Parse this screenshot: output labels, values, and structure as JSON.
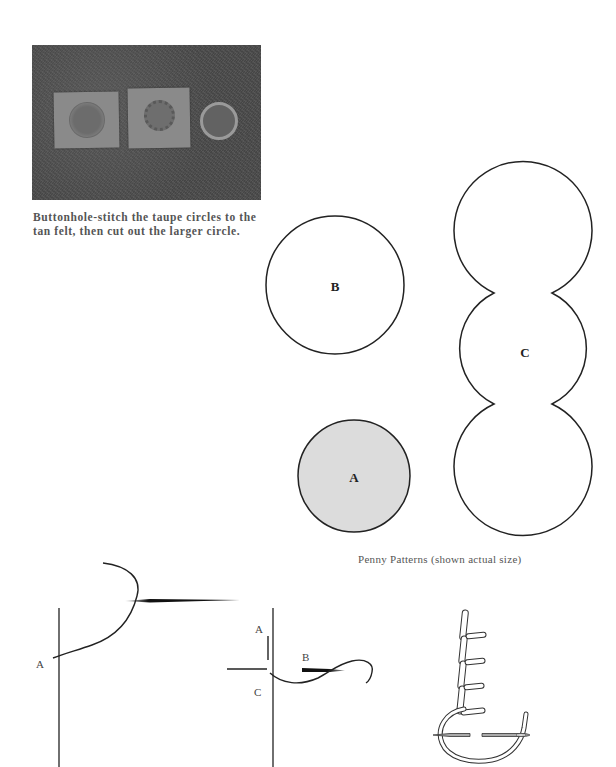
{
  "photo": {
    "description": "Three tan felt pieces with stitched taupe circles on a dark textured surface",
    "caption": "Buttonhole-stitch the taupe circles to the tan felt, then cut out the larger circle."
  },
  "patterns": {
    "caption": "Penny Patterns (shown actual size)",
    "shapes": [
      {
        "label": "B",
        "type": "circle",
        "fill": "#ffffff"
      },
      {
        "label": "A",
        "type": "circle",
        "fill": "#dcdcdc"
      },
      {
        "label": "C",
        "type": "triple-circle",
        "fill": "#ffffff"
      }
    ]
  },
  "diagrams": {
    "stitch_left": {
      "labels": [
        "A"
      ]
    },
    "stitch_middle": {
      "labels": [
        "A",
        "B",
        "C"
      ]
    },
    "stitch_right": {
      "description": "buttonhole-stitch-illustration"
    }
  },
  "colors": {
    "stroke": "#222222",
    "circle_a_fill": "#dcdcdc",
    "caption_text": "#555555"
  }
}
